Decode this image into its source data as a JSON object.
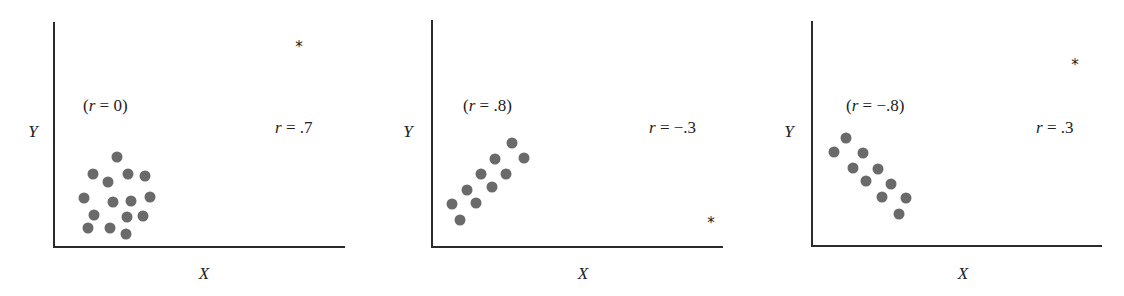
{
  "chart_data": [
    {
      "type": "scatter",
      "title": "",
      "xlabel": "X",
      "ylabel": "Y",
      "grid": false,
      "axes": {
        "origin": [
          54,
          247
        ],
        "x_end": 345,
        "y_top": 22
      },
      "cluster_label": {
        "text": "(r = 0)",
        "r_value": 0,
        "pos": [
          83,
          111
        ]
      },
      "outlier_label": {
        "text": "r = .7",
        "r_value": 0.7,
        "pos": [
          275,
          133
        ]
      },
      "outlier": {
        "symbol": "*",
        "pos": [
          299,
          52
        ]
      },
      "ylabel_pos": [
        33,
        137
      ],
      "xlabel_pos": [
        204,
        279
      ],
      "points": [
        [
          117,
          157
        ],
        [
          93,
          174
        ],
        [
          108,
          182
        ],
        [
          128,
          174
        ],
        [
          145,
          176
        ],
        [
          84,
          198
        ],
        [
          113,
          202
        ],
        [
          131,
          201
        ],
        [
          150,
          197
        ],
        [
          94,
          215
        ],
        [
          127,
          217
        ],
        [
          143,
          216
        ],
        [
          88,
          228
        ],
        [
          110,
          228
        ],
        [
          126,
          234
        ]
      ]
    },
    {
      "type": "scatter",
      "title": "",
      "xlabel": "X",
      "ylabel": "Y",
      "grid": false,
      "axes": {
        "origin": [
          432,
          247
        ],
        "x_end": 723,
        "y_top": 20
      },
      "cluster_label": {
        "text": "(r = .8)",
        "r_value": 0.8,
        "pos": [
          463,
          111
        ]
      },
      "outlier_label": {
        "text": "r = −.3",
        "r_value": -0.3,
        "pos": [
          649,
          133
        ]
      },
      "outlier": {
        "symbol": "*",
        "pos": [
          711,
          228
        ]
      },
      "ylabel_pos": [
        408,
        137
      ],
      "xlabel_pos": [
        583,
        279
      ],
      "points": [
        [
          452,
          204
        ],
        [
          460,
          220
        ],
        [
          467,
          190
        ],
        [
          476,
          203
        ],
        [
          481,
          174
        ],
        [
          492,
          187
        ],
        [
          495,
          159
        ],
        [
          506,
          174
        ],
        [
          512,
          143
        ],
        [
          524,
          158
        ]
      ]
    },
    {
      "type": "scatter",
      "title": "",
      "xlabel": "X",
      "ylabel": "Y",
      "grid": false,
      "axes": {
        "origin": [
          812,
          246
        ],
        "x_end": 1102,
        "y_top": 21
      },
      "cluster_label": {
        "text": "(r = −.8)",
        "r_value": -0.8,
        "pos": [
          846,
          111
        ]
      },
      "outlier_label": {
        "text": "r = .3",
        "r_value": 0.3,
        "pos": [
          1036,
          133
        ]
      },
      "outlier": {
        "symbol": "*",
        "pos": [
          1075,
          70
        ]
      },
      "ylabel_pos": [
        789,
        137
      ],
      "xlabel_pos": [
        963,
        279
      ],
      "points": [
        [
          846,
          138
        ],
        [
          834,
          152
        ],
        [
          863,
          153
        ],
        [
          853,
          168
        ],
        [
          878,
          169
        ],
        [
          866,
          181
        ],
        [
          891,
          184
        ],
        [
          882,
          197
        ],
        [
          906,
          198
        ],
        [
          899,
          214
        ]
      ]
    }
  ],
  "style": {
    "dot_color": "#6a6a6a",
    "axis_color": "#2b2b2b",
    "text_color": "#222222",
    "dot_radius": 5.5
  }
}
